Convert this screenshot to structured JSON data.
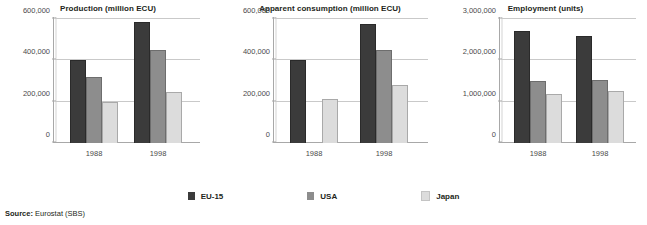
{
  "legend": {
    "items": [
      {
        "label": "EU-15",
        "color": "#3b3b3b"
      },
      {
        "label": "USA",
        "color": "#8d8d8d"
      },
      {
        "label": "Japan",
        "color": "#dcdcdc"
      }
    ]
  },
  "source": {
    "label": "Source:",
    "value": "Eurostat (SBS)"
  },
  "chart_data": [
    {
      "type": "bar",
      "title": "Production (million ECU)",
      "xlabel": "",
      "ylabel": "",
      "categories": [
        "1988",
        "1998"
      ],
      "ylim": [
        0,
        600000
      ],
      "yticks": [
        0,
        200000,
        400000,
        600000
      ],
      "ytick_labels": [
        "0",
        "200,000",
        "400,000",
        "600,000"
      ],
      "grid": true,
      "legend_position": "bottom",
      "series": [
        {
          "name": "EU-15",
          "color": "#3b3b3b",
          "values": [
            400000,
            585000
          ]
        },
        {
          "name": "USA",
          "color": "#8d8d8d",
          "values": [
            320000,
            452000
          ]
        },
        {
          "name": "Japan",
          "color": "#dcdcdc",
          "values": [
            198000,
            248000
          ]
        }
      ]
    },
    {
      "type": "bar",
      "title": "Apparent consumption (million ECU)",
      "xlabel": "",
      "ylabel": "",
      "categories": [
        "1988",
        "1998"
      ],
      "ylim": [
        0,
        600000
      ],
      "yticks": [
        0,
        200000,
        400000,
        600000
      ],
      "ytick_labels": [
        "0",
        "200,000",
        "400,000",
        "600,000"
      ],
      "grid": true,
      "legend_position": "bottom",
      "series": [
        {
          "name": "EU-15",
          "color": "#3b3b3b",
          "values": [
            400000,
            575000
          ]
        },
        {
          "name": "USA",
          "color": "#8d8d8d",
          "values": [
            0,
            450000
          ]
        },
        {
          "name": "Japan",
          "color": "#dcdcdc",
          "values": [
            213000,
            280000
          ]
        }
      ]
    },
    {
      "type": "bar",
      "title": "Employment (units)",
      "xlabel": "",
      "ylabel": "",
      "categories": [
        "1988",
        "1998"
      ],
      "ylim": [
        0,
        3000000
      ],
      "yticks": [
        0,
        1000000,
        2000000,
        3000000
      ],
      "ytick_labels": [
        "0",
        "1,000,000",
        "2,000,000",
        "3,000,000"
      ],
      "grid": true,
      "legend_position": "bottom",
      "series": [
        {
          "name": "EU-15",
          "color": "#3b3b3b",
          "values": [
            2700000,
            2600000
          ]
        },
        {
          "name": "USA",
          "color": "#8d8d8d",
          "values": [
            1500000,
            1520000
          ]
        },
        {
          "name": "Japan",
          "color": "#dcdcdc",
          "values": [
            1180000,
            1250000
          ]
        }
      ]
    }
  ]
}
